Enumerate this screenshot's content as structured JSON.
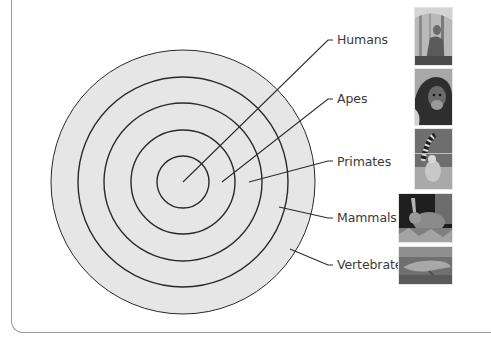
{
  "diagram": {
    "center": {
      "x": 183,
      "y": 182
    },
    "fill_color": "#e6e6e6",
    "stroke_color": "#2a2a2a",
    "rings": [
      {
        "name": "Vertebrates",
        "radius": 132
      },
      {
        "name": "Mammals",
        "radius": 105
      },
      {
        "name": "Primates",
        "radius": 79
      },
      {
        "name": "Apes",
        "radius": 52
      },
      {
        "name": "Humans",
        "radius": 26
      }
    ],
    "labels": [
      {
        "text": "Humans",
        "x": 337,
        "y": 33,
        "pointer_from": [
          183,
          182
        ],
        "pointer_to": [
          328,
          40
        ]
      },
      {
        "text": "Apes",
        "x": 337,
        "y": 92,
        "pointer_from": [
          222,
          182
        ],
        "pointer_to": [
          328,
          99
        ]
      },
      {
        "text": "Primates",
        "x": 337,
        "y": 155,
        "pointer_from": [
          249,
          182
        ],
        "pointer_to": [
          328,
          161
        ]
      },
      {
        "text": "Mammals",
        "x": 337,
        "y": 211,
        "pointer_from": [
          279,
          207
        ],
        "pointer_to": [
          328,
          218
        ]
      },
      {
        "text": "Vertebrates",
        "x": 337,
        "y": 258,
        "pointer_from": [
          290,
          249
        ],
        "pointer_to": [
          328,
          265
        ]
      }
    ],
    "photos": [
      {
        "subject": "human-in-forest-photo",
        "x": 415,
        "y": 8,
        "w": 37,
        "h": 57
      },
      {
        "subject": "chimpanzee-photo",
        "x": 415,
        "y": 69,
        "w": 37,
        "h": 56
      },
      {
        "subject": "ring-tailed-lemur-photo",
        "x": 415,
        "y": 129,
        "w": 37,
        "h": 60
      },
      {
        "subject": "rabbit-photo",
        "x": 399,
        "y": 194,
        "w": 53,
        "h": 48
      },
      {
        "subject": "crocodile-photo",
        "x": 399,
        "y": 247,
        "w": 53,
        "h": 37
      }
    ]
  }
}
